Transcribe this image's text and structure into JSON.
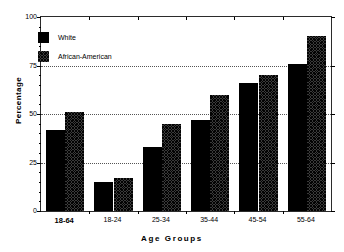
{
  "chart_data": {
    "type": "bar",
    "title": "",
    "xlabel": "Age  Groups",
    "ylabel": "Percentage",
    "categories": [
      "18-64",
      "18-24",
      "25-34",
      "35-44",
      "45-54",
      "55-64"
    ],
    "category_emphasis": [
      true,
      false,
      false,
      false,
      false,
      false
    ],
    "series": [
      {
        "name": "White",
        "values": [
          42,
          15,
          33,
          47,
          66,
          76
        ],
        "fill": "solid-black",
        "color": "#000000"
      },
      {
        "name": "African-American",
        "values": [
          51,
          17,
          45,
          60,
          70,
          90
        ],
        "fill": "crosshatch",
        "color": "#3a3a3a"
      }
    ],
    "ylim": [
      0,
      100
    ],
    "yticks": [
      0,
      25,
      50,
      75,
      100
    ],
    "ytick_labels": [
      "0",
      "25",
      "50",
      "75",
      "100"
    ],
    "y_minor_ticks": [
      5,
      10,
      15,
      20,
      30,
      35,
      40,
      45,
      55,
      60,
      65,
      70,
      80,
      85,
      90,
      95
    ],
    "grid": "horizontal-dotted-at-25-50-75",
    "legend_position": "upper-left-inside",
    "legend": [
      "White",
      "African-American"
    ]
  }
}
